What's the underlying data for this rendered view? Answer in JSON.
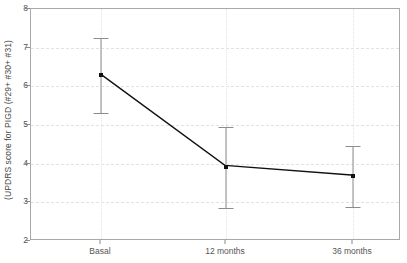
{
  "chart_data": {
    "type": "line",
    "title": "",
    "xlabel": "",
    "ylabel": "(UPDRS score for PIGD (#29+ #30+ #31)",
    "categories": [
      "Basal",
      "12 months",
      "36 months"
    ],
    "values": [
      6.3,
      3.92,
      3.67
    ],
    "error_upper": [
      7.25,
      4.95,
      4.45
    ],
    "error_lower": [
      5.3,
      2.85,
      2.88
    ],
    "ylim": [
      2,
      8
    ],
    "yticks": [
      2,
      3,
      4,
      5,
      6,
      7,
      8
    ],
    "ytick_labels": [
      "2",
      "3",
      "4",
      "5",
      "6",
      "7",
      "8"
    ],
    "grid": true,
    "legend": "none",
    "series": [
      {
        "name": "UPDRS PIGD score",
        "values": [
          6.3,
          3.92,
          3.67
        ],
        "color": "#111111"
      }
    ],
    "errorbar_color": "#8c8c8c",
    "gridline_color": "#e2e2e2",
    "frame_color": "#a8a8a8"
  }
}
